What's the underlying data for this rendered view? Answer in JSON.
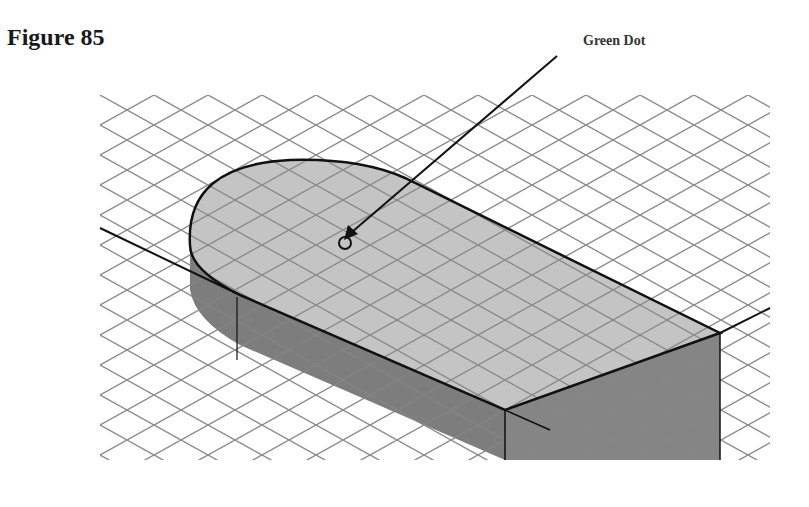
{
  "figure": {
    "title": "Figure 85",
    "callout_label": "Green Dot",
    "colors": {
      "grid": "#8a8a8a",
      "top_face": "#c4c4c4",
      "side_face": "#7d7d7d",
      "front_face": "#8a8a8a",
      "edge": "#111111"
    }
  }
}
